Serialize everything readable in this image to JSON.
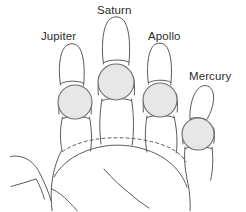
{
  "diagram": {
    "background_color": "#ffffff",
    "line_color": "#5a5a5a",
    "circle_fill_color": "#e6e6e6",
    "circle_stroke_color": "#6e6e6e",
    "label_color": "#2b2b2b"
  },
  "labels": {
    "jupiter": "Jupiter",
    "saturn": "Saturn",
    "apollo": "Apollo",
    "mercury": "Mercury"
  },
  "fingers": [
    {
      "name": "jupiter",
      "label": "Jupiter",
      "position": "index",
      "highlight_circle": {
        "cx": 75,
        "cy": 102,
        "r": 17
      }
    },
    {
      "name": "saturn",
      "label": "Saturn",
      "position": "middle",
      "highlight_circle": {
        "cx": 116,
        "cy": 82,
        "r": 18
      }
    },
    {
      "name": "apollo",
      "label": "Apollo",
      "position": "ring",
      "highlight_circle": {
        "cx": 160,
        "cy": 100,
        "r": 17
      }
    },
    {
      "name": "mercury",
      "label": "Mercury",
      "position": "little",
      "highlight_circle": {
        "cx": 198,
        "cy": 134,
        "r": 16
      }
    }
  ]
}
